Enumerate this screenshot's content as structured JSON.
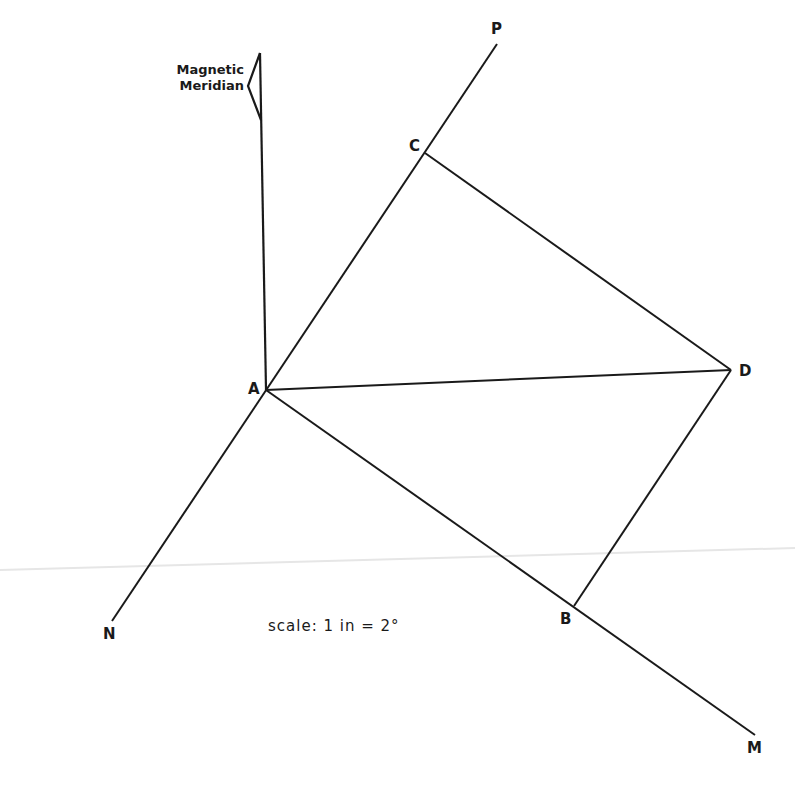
{
  "diagram": {
    "meridian_label_line1": "Magnetic",
    "meridian_label_line2": "Meridian",
    "points": {
      "A": "A",
      "B": "B",
      "C": "C",
      "D": "D",
      "P": "P",
      "N": "N",
      "M": "M"
    },
    "scale_text": "scale: 1 in = 2°",
    "colors": {
      "line": "#1a1a1a",
      "background": "#ffffff"
    }
  }
}
